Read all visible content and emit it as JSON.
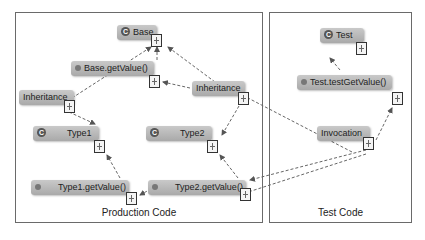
{
  "diagram": {
    "groups": [
      {
        "id": "production",
        "label": "Production Code"
      },
      {
        "id": "test",
        "label": "Test Code"
      }
    ],
    "nodes": {
      "base": {
        "label": "Base",
        "kind": "class",
        "icon": "class-icon"
      },
      "base_getvalue": {
        "label": "Base.getValue()",
        "kind": "method",
        "icon": "method-icon"
      },
      "inheritance_left": {
        "label": "Inheritance",
        "kind": "relation"
      },
      "inheritance_mid": {
        "label": "Inheritance",
        "kind": "relation"
      },
      "type1": {
        "label": "Type1",
        "kind": "class",
        "icon": "class-icon"
      },
      "type2": {
        "label": "Type2",
        "kind": "class",
        "icon": "class-icon"
      },
      "type1_getvalue": {
        "label": "Type1.getValue()",
        "kind": "method",
        "icon": "method-icon"
      },
      "type2_getvalue": {
        "label": "Type2.getValue()",
        "kind": "method",
        "icon": "method-icon"
      },
      "test": {
        "label": "Test",
        "kind": "class",
        "icon": "class-icon"
      },
      "test_testgetvalue": {
        "label": "Test.testGetValue()",
        "kind": "method",
        "icon": "method-icon"
      },
      "invocation": {
        "label": "Invocation",
        "kind": "relation"
      }
    },
    "class_glyph": "C",
    "edges": [
      {
        "from": "base_getvalue",
        "to": "base",
        "style": "dashed"
      },
      {
        "from": "inheritance_left",
        "to": "base",
        "style": "dashed"
      },
      {
        "from": "inheritance_mid",
        "to": "base",
        "style": "dashed"
      },
      {
        "from": "inheritance_mid",
        "to": "base_getvalue",
        "style": "dashed"
      },
      {
        "from": "inheritance_left",
        "to": "type1",
        "style": "dashed"
      },
      {
        "from": "inheritance_mid",
        "to": "type2",
        "style": "dashed"
      },
      {
        "from": "type1_getvalue",
        "to": "type1",
        "style": "dashed"
      },
      {
        "from": "type2_getvalue",
        "to": "type2",
        "style": "dashed"
      },
      {
        "from": "type2_getvalue",
        "to": "type1_getvalue",
        "style": "dashed"
      },
      {
        "from": "test_testgetvalue",
        "to": "test",
        "style": "dashed"
      },
      {
        "from": "invocation",
        "to": "test_testgetvalue",
        "style": "dashed"
      },
      {
        "from": "invocation",
        "to": "inheritance_mid",
        "style": "dashed"
      },
      {
        "from": "invocation",
        "to": "type2_getvalue",
        "style": "dashed"
      },
      {
        "from": "invocation",
        "to": "type1_getvalue",
        "style": "dashed"
      }
    ]
  }
}
